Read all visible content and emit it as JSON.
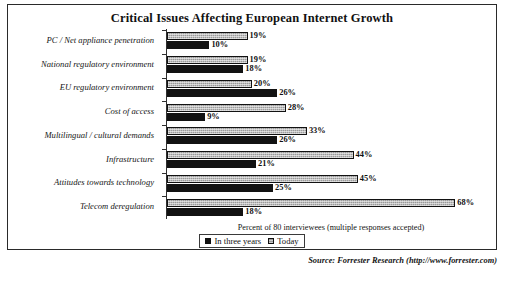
{
  "chart_data": {
    "type": "bar",
    "orientation": "horizontal",
    "title": "Critical Issues Affecting European Internet Growth",
    "xlabel": "Percent of 80 interviewees (multiple responses accepted)",
    "ylabel": "",
    "xlim": [
      0,
      75
    ],
    "grid": false,
    "legend_position": "bottom-center",
    "categories": [
      "PC / Net appliance penetration",
      "National regulatory environment",
      "EU regulatory environment",
      "Cost of access",
      "Multilingual / cultural demands",
      "Infrastructure",
      "Attitudes towards technology",
      "Telecom deregulation"
    ],
    "series": [
      {
        "name": "In three years",
        "values": [
          19,
          19,
          20,
          28,
          33,
          44,
          45,
          68
        ],
        "value_labels": [
          "19%",
          "19%",
          "20%",
          "28%",
          "33%",
          "44%",
          "45%",
          "68%"
        ],
        "color": "#9a9a9a",
        "style": "hatched-grey"
      },
      {
        "name": "Today",
        "values": [
          10,
          18,
          26,
          9,
          26,
          21,
          25,
          18
        ],
        "value_labels": [
          "10%",
          "18%",
          "26%",
          "9%",
          "26%",
          "21%",
          "25%",
          "18%"
        ],
        "color": "#121212",
        "style": "solid-dark"
      }
    ],
    "source_note": "Source: Forrester Research (http://www.forrester.com)"
  },
  "legend": {
    "items": [
      {
        "label": "In three years",
        "swatch": "future-sw"
      },
      {
        "label": "Today",
        "swatch": "today-sw"
      }
    ]
  }
}
